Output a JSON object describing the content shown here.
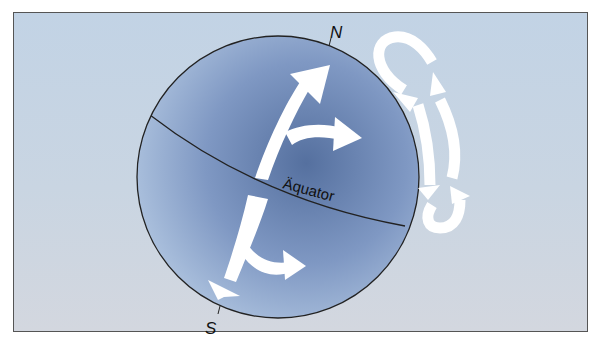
{
  "diagram": {
    "title": "",
    "labels": {
      "north": "N",
      "south": "S",
      "equator": "Äquator"
    },
    "elements": [
      {
        "type": "globe",
        "description": "tilted Earth sphere, blue shading"
      },
      {
        "type": "equator-line",
        "label": "Äquator"
      },
      {
        "type": "arrow",
        "description": "northern hemisphere flow arrow splitting: one branch toward N pole, one curving east (right)"
      },
      {
        "type": "arrow",
        "description": "southern hemisphere flow arrow splitting: one branch toward S pole, one curving east (right)"
      },
      {
        "type": "circulation-loop",
        "description": "upper convection cell loop beside globe (clockwise)"
      },
      {
        "type": "circulation-loop",
        "description": "lower convection cell loop beside globe"
      }
    ],
    "colors": {
      "background": "#c6d4e3",
      "globe_light": "#a9bfdc",
      "globe_dark": "#5f79a6",
      "arrows": "#ffffff",
      "outline": "#222222"
    }
  }
}
